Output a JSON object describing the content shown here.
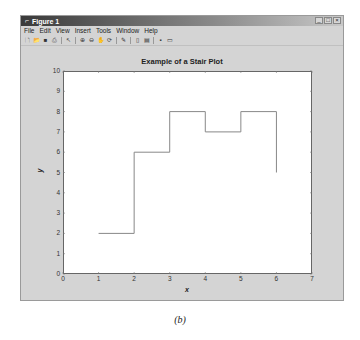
{
  "window": {
    "title": "Figure 1",
    "title_icon": "matlab-icon",
    "controls": {
      "minimize": "_",
      "maximize": "□",
      "close": "×"
    }
  },
  "menubar": {
    "items": [
      {
        "label": "File"
      },
      {
        "label": "Edit"
      },
      {
        "label": "View"
      },
      {
        "label": "Insert"
      },
      {
        "label": "Tools"
      },
      {
        "label": "Window"
      },
      {
        "label": "Help"
      }
    ]
  },
  "toolbar": {
    "buttons": [
      {
        "name": "new-figure-icon",
        "glyph": "🗋"
      },
      {
        "name": "open-file-icon",
        "glyph": "📂"
      },
      {
        "name": "save-icon",
        "glyph": "■"
      },
      {
        "name": "print-icon",
        "glyph": "⎙"
      },
      {
        "name": "separator"
      },
      {
        "name": "edit-plot-pointer-icon",
        "glyph": "↖"
      },
      {
        "name": "separator"
      },
      {
        "name": "zoom-in-icon",
        "glyph": "⊕"
      },
      {
        "name": "zoom-out-icon",
        "glyph": "⊖"
      },
      {
        "name": "pan-hand-icon",
        "glyph": "✋"
      },
      {
        "name": "rotate-3d-icon",
        "glyph": "⟳"
      },
      {
        "name": "separator"
      },
      {
        "name": "data-cursor-icon",
        "glyph": "✎"
      },
      {
        "name": "separator"
      },
      {
        "name": "insert-colorbar-icon",
        "glyph": "▯"
      },
      {
        "name": "insert-legend-icon",
        "glyph": "▤"
      },
      {
        "name": "separator"
      },
      {
        "name": "hide-plot-tools-icon",
        "glyph": "▪"
      },
      {
        "name": "show-plot-tools-icon",
        "glyph": "▭"
      }
    ]
  },
  "caption": "(b)",
  "chart_data": {
    "type": "line",
    "subtype": "stairs",
    "title": "Example of a Stair Plot",
    "xlabel": "x",
    "ylabel": "y",
    "x": [
      1,
      2,
      3,
      4,
      5,
      6
    ],
    "y": [
      2,
      6,
      8,
      7,
      8,
      5
    ],
    "xlim": [
      0,
      7
    ],
    "ylim": [
      0,
      10
    ],
    "xticks": [
      "0",
      "1",
      "2",
      "3",
      "4",
      "5",
      "6",
      "7"
    ],
    "yticks": [
      "0",
      "1",
      "2",
      "3",
      "4",
      "5",
      "6",
      "7",
      "8",
      "9",
      "10"
    ],
    "grid": false,
    "legend": null,
    "line_color": "#888888"
  }
}
